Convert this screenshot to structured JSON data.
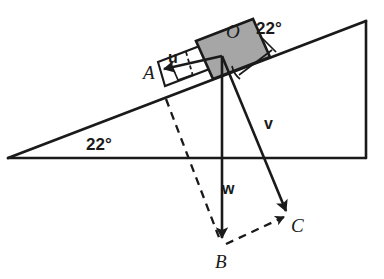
{
  "figure": {
    "kind": "physics-free-body-diagram-inclined-plane",
    "colors": {
      "stroke": "#1a1a1a",
      "block_fill": "#a6a6a6",
      "block_stroke": "#1a1a1a",
      "background": "#ffffff"
    },
    "incline": {
      "angle_label": "22°",
      "apex_left": [
        8,
        158
      ],
      "corner_bottom_right": [
        366,
        158
      ],
      "corner_top_right": [
        366,
        21
      ]
    },
    "block": {
      "label": "O",
      "fill": "#a6a6a6"
    },
    "angles": [
      {
        "name": "incline-base-angle",
        "text": "22°",
        "x": 86,
        "y": 136
      },
      {
        "name": "block-normal-angle",
        "text": "22°",
        "x": 256,
        "y": 20
      }
    ],
    "vectors": [
      {
        "name": "u",
        "label": "u",
        "label_x": 168,
        "label_y": 50,
        "from": [
          222,
          56
        ],
        "to": [
          160,
          70
        ],
        "style": "solid"
      },
      {
        "name": "v",
        "label": "v",
        "label_x": 264,
        "label_y": 116,
        "from": [
          222,
          56
        ],
        "to": [
          288,
          215
        ],
        "style": "solid"
      },
      {
        "name": "w",
        "label": "w",
        "label_x": 222,
        "label_y": 181,
        "from": [
          222,
          56
        ],
        "to": [
          222,
          243
        ],
        "style": "solid"
      }
    ],
    "points": [
      {
        "name": "A",
        "label": "A",
        "x": 143,
        "y": 63
      },
      {
        "name": "O",
        "label": "O",
        "x": 226,
        "y": 22
      },
      {
        "name": "B",
        "label": "B",
        "x": 215,
        "y": 252
      },
      {
        "name": "C",
        "label": "C",
        "x": 291,
        "y": 216
      }
    ],
    "dashed_segments": [
      {
        "name": "dashed-A-to-B",
        "from": [
          166,
          99
        ],
        "to": [
          221,
          242
        ]
      },
      {
        "name": "dashed-B-to-C",
        "from": [
          222,
          244
        ],
        "to": [
          288,
          215
        ]
      }
    ]
  }
}
